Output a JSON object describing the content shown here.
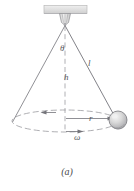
{
  "figure": {
    "caption": "(a)",
    "colors": {
      "stroke": "#6e6e72",
      "ceiling_fill": "#dcdcdc",
      "ceiling_stroke": "#b4b4b4",
      "bracket_fill": "#e2e2e2",
      "ball_fill": "#cfcfcf",
      "ball_highlight": "#f2f2f2",
      "ball_stroke": "#7a7a7e",
      "label_color": "#59595c",
      "background": "#ffffff"
    },
    "labels": {
      "theta": "θ",
      "length": "l",
      "height": "h",
      "radius": "r",
      "angular_velocity": "ω"
    },
    "elements": {
      "ceiling": "ceiling-support-bar",
      "bracket": "pivot-bracket",
      "string_left": "cone-edge-left",
      "string_right": "pendulum-string",
      "axis": "vertical-axis-dashed",
      "circle_path": "circular-path-ellipse",
      "radius_arrow": "radius-arrow",
      "motion_arrow": "motion-direction-arrow",
      "omega_arrow": "angular-velocity-arrow",
      "bob": "pendulum-bob"
    },
    "geometry": {
      "apex_x": 65,
      "apex_y": 25,
      "bob_x": 118,
      "bob_y": 120,
      "bob_radius": 9,
      "ellipse_cx": 65,
      "ellipse_cy": 121,
      "ellipse_rx": 53,
      "ellipse_ry": 11,
      "ceiling_x": 44,
      "ceiling_y": 5,
      "ceiling_w": 43,
      "ceiling_h": 8
    }
  }
}
